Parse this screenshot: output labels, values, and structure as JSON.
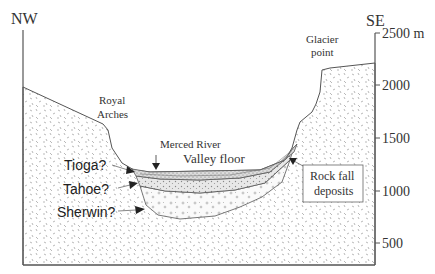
{
  "directions": {
    "left": "NW",
    "right": "SE"
  },
  "elevation_axis": {
    "unit": "m",
    "ticks": [
      {
        "value": 2500,
        "label": "2500 m"
      },
      {
        "value": 2000,
        "label": "2000"
      },
      {
        "value": 1500,
        "label": "1500"
      },
      {
        "value": 1000,
        "label": "1000"
      },
      {
        "value": 500,
        "label": "500"
      }
    ]
  },
  "landmarks": {
    "royal_arches": [
      "Royal",
      "Arches"
    ],
    "glacier_point": [
      "Glacier",
      "point"
    ],
    "merced_river": "Merced River",
    "valley_floor": "Valley floor"
  },
  "glacial_deposits": [
    {
      "name": "Tioga?"
    },
    {
      "name": "Tahoe?"
    },
    {
      "name": "Sherwin?"
    }
  ],
  "rock_fall_box": [
    "Rock fall",
    "deposits"
  ],
  "colors": {
    "line": "#555555",
    "bedrock_speckle": "#9a9a9a",
    "tioga_fill": "#d4d4d4",
    "tahoe_fill": "#e2e2e2",
    "text": "#333333"
  }
}
